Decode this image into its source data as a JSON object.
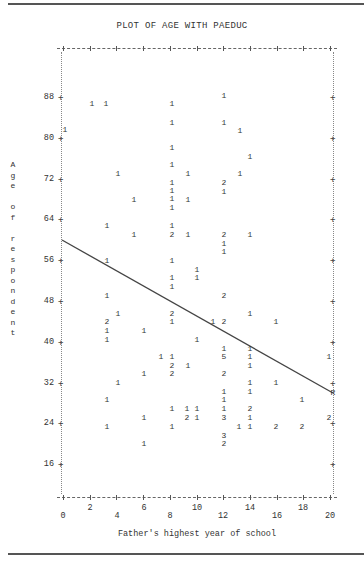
{
  "page": {
    "title": "PLOT OF AGE WITH PAEDUC",
    "ylabel": "Age of respondent",
    "ylabel_chars": [
      "A",
      "g",
      "e",
      " ",
      "o",
      "f",
      " ",
      "r",
      "e",
      "s",
      "p",
      "o",
      "n",
      "d",
      "e",
      "n",
      "t"
    ],
    "xlabel": "Father's highest year of school",
    "regression_marker": "R"
  },
  "axes": {
    "y_ticks": [
      "88",
      "80",
      "72",
      "64",
      "56",
      "48",
      "40",
      "32",
      "24",
      "16"
    ],
    "x_ticks_upper": [
      "2",
      "6",
      "10",
      "14",
      "18"
    ],
    "x_ticks_lower": [
      "0",
      "4",
      "8",
      "12",
      "16",
      "20"
    ]
  },
  "chart_data": {
    "type": "scatter",
    "title": "PLOT OF AGE WITH PAEDUC",
    "xlabel": "Father's highest year of school",
    "ylabel": "Age of respondent",
    "xlim": [
      0,
      20
    ],
    "ylim": [
      16,
      88
    ],
    "x_ticks": [
      0,
      2,
      4,
      6,
      8,
      10,
      12,
      14,
      16,
      18,
      20
    ],
    "y_ticks": [
      16,
      24,
      32,
      40,
      48,
      56,
      64,
      72,
      80,
      88
    ],
    "grid": false,
    "legend": "none",
    "marker_note": "digits indicate number of cases at each plotted position",
    "regression_line": {
      "x0": 0,
      "y0": 56.5,
      "x1": 20,
      "y1": 28.5,
      "endpoint_label": "R"
    },
    "points": [
      {
        "x": 2.3,
        "y": 81.5,
        "n": 1
      },
      {
        "x": 3.3,
        "y": 81.5,
        "n": 1
      },
      {
        "x": 8.0,
        "y": 81.5,
        "n": 1
      },
      {
        "x": 12.0,
        "y": 83.5,
        "n": 1
      },
      {
        "x": 0.2,
        "y": 76.5,
        "n": 1
      },
      {
        "x": 8.0,
        "y": 78.5,
        "n": 1
      },
      {
        "x": 12.0,
        "y": 78.5,
        "n": 1
      },
      {
        "x": 13.2,
        "y": 77.0,
        "n": 1
      },
      {
        "x": 8.0,
        "y": 73.5,
        "n": 1
      },
      {
        "x": 14.0,
        "y": 71.5,
        "n": 1
      },
      {
        "x": 8.0,
        "y": 70.5,
        "n": 1
      },
      {
        "x": 4.2,
        "y": 68.0,
        "n": 1
      },
      {
        "x": 8.0,
        "y": 67.5,
        "n": 1
      },
      {
        "x": 9.2,
        "y": 68.0,
        "n": 1
      },
      {
        "x": 13.2,
        "y": 68.0,
        "n": 1
      },
      {
        "x": 8.0,
        "y": 66.0,
        "n": 1
      },
      {
        "x": 12.0,
        "y": 66.5,
        "n": 2
      },
      {
        "x": 8.0,
        "y": 64.5,
        "n": 1
      },
      {
        "x": 12.0,
        "y": 64.5,
        "n": 1
      },
      {
        "x": 5.2,
        "y": 63.0,
        "n": 1
      },
      {
        "x": 9.2,
        "y": 63.0,
        "n": 1
      },
      {
        "x": 8.0,
        "y": 62.0,
        "n": 1
      },
      {
        "x": 3.3,
        "y": 59.5,
        "n": 1
      },
      {
        "x": 8.0,
        "y": 59.5,
        "n": 1
      },
      {
        "x": 5.2,
        "y": 58.0,
        "n": 1
      },
      {
        "x": 8.0,
        "y": 58.0,
        "n": 2
      },
      {
        "x": 9.2,
        "y": 58.0,
        "n": 1
      },
      {
        "x": 12.0,
        "y": 58.0,
        "n": 2
      },
      {
        "x": 14.0,
        "y": 58.0,
        "n": 1
      },
      {
        "x": 12.0,
        "y": 56.5,
        "n": 1
      },
      {
        "x": 12.0,
        "y": 55.0,
        "n": 1
      },
      {
        "x": 3.3,
        "y": 52.5,
        "n": 1
      },
      {
        "x": 8.0,
        "y": 52.5,
        "n": 1
      },
      {
        "x": 10.0,
        "y": 51.0,
        "n": 1
      },
      {
        "x": 8.0,
        "y": 49.5,
        "n": 1
      },
      {
        "x": 10.0,
        "y": 49.5,
        "n": 1
      },
      {
        "x": 8.0,
        "y": 48.0,
        "n": 1
      },
      {
        "x": 3.3,
        "y": 46.5,
        "n": 1
      },
      {
        "x": 12.0,
        "y": 46.5,
        "n": 2
      },
      {
        "x": 4.0,
        "y": 43.5,
        "n": 1
      },
      {
        "x": 8.0,
        "y": 43.5,
        "n": 2
      },
      {
        "x": 14.0,
        "y": 43.5,
        "n": 1
      },
      {
        "x": 3.3,
        "y": 42.0,
        "n": 2
      },
      {
        "x": 8.0,
        "y": 42.0,
        "n": 1
      },
      {
        "x": 11.5,
        "y": 42.0,
        "n": 1
      },
      {
        "x": 12.0,
        "y": 42.0,
        "n": 2
      },
      {
        "x": 16.0,
        "y": 42.0,
        "n": 1
      },
      {
        "x": 3.3,
        "y": 40.5,
        "n": 1
      },
      {
        "x": 6.0,
        "y": 40.5,
        "n": 1
      },
      {
        "x": 3.3,
        "y": 39.0,
        "n": 1
      },
      {
        "x": 10.0,
        "y": 39.0,
        "n": 1
      },
      {
        "x": 12.0,
        "y": 37.0,
        "n": 1
      },
      {
        "x": 14.0,
        "y": 37.0,
        "n": 1
      },
      {
        "x": 7.5,
        "y": 35.5,
        "n": 1
      },
      {
        "x": 8.0,
        "y": 35.5,
        "n": 1
      },
      {
        "x": 12.0,
        "y": 35.5,
        "n": 5
      },
      {
        "x": 14.0,
        "y": 35.5,
        "n": 1
      },
      {
        "x": 20.0,
        "y": 35.5,
        "n": 1
      },
      {
        "x": 8.0,
        "y": 34.0,
        "n": 2
      },
      {
        "x": 9.2,
        "y": 34.0,
        "n": 1
      },
      {
        "x": 14.0,
        "y": 34.0,
        "n": 1
      },
      {
        "x": 6.0,
        "y": 32.5,
        "n": 1
      },
      {
        "x": 8.0,
        "y": 32.5,
        "n": 2
      },
      {
        "x": 12.0,
        "y": 32.5,
        "n": 2
      },
      {
        "x": 4.0,
        "y": 30.5,
        "n": 1
      },
      {
        "x": 14.0,
        "y": 30.5,
        "n": 1
      },
      {
        "x": 16.0,
        "y": 30.5,
        "n": 1
      },
      {
        "x": 12.0,
        "y": 29.0,
        "n": 1
      },
      {
        "x": 14.0,
        "y": 29.0,
        "n": 1
      },
      {
        "x": 3.3,
        "y": 27.5,
        "n": 1
      },
      {
        "x": 12.0,
        "y": 27.5,
        "n": 1
      },
      {
        "x": 18.0,
        "y": 27.5,
        "n": 1
      },
      {
        "x": 8.0,
        "y": 26.0,
        "n": 1
      },
      {
        "x": 9.2,
        "y": 26.0,
        "n": 1
      },
      {
        "x": 10.0,
        "y": 26.0,
        "n": 1
      },
      {
        "x": 12.0,
        "y": 26.0,
        "n": 1
      },
      {
        "x": 14.0,
        "y": 26.0,
        "n": 2
      },
      {
        "x": 6.0,
        "y": 24.5,
        "n": 1
      },
      {
        "x": 9.2,
        "y": 24.5,
        "n": 2
      },
      {
        "x": 10.0,
        "y": 24.5,
        "n": 1
      },
      {
        "x": 12.0,
        "y": 24.5,
        "n": 3
      },
      {
        "x": 14.0,
        "y": 24.5,
        "n": 1
      },
      {
        "x": 20.0,
        "y": 24.5,
        "n": 2
      },
      {
        "x": 3.3,
        "y": 23.0,
        "n": 1
      },
      {
        "x": 8.0,
        "y": 23.0,
        "n": 1
      },
      {
        "x": 13.2,
        "y": 23.0,
        "n": 1
      },
      {
        "x": 14.0,
        "y": 23.0,
        "n": 1
      },
      {
        "x": 16.0,
        "y": 23.0,
        "n": 2
      },
      {
        "x": 18.0,
        "y": 23.0,
        "n": 2
      },
      {
        "x": 12.0,
        "y": 21.5,
        "n": 3
      },
      {
        "x": 6.0,
        "y": 20.0,
        "n": 1
      },
      {
        "x": 12.0,
        "y": 20.0,
        "n": 2
      }
    ]
  },
  "markers": [
    {
      "px": 92,
      "py": 104,
      "n": "1"
    },
    {
      "px": 106,
      "py": 104,
      "n": "1"
    },
    {
      "px": 172,
      "py": 104,
      "n": "1"
    },
    {
      "px": 224,
      "py": 96,
      "n": "1"
    },
    {
      "px": 65,
      "py": 130,
      "n": "1"
    },
    {
      "px": 172,
      "py": 123,
      "n": "1"
    },
    {
      "px": 224,
      "py": 123,
      "n": "1"
    },
    {
      "px": 240,
      "py": 131,
      "n": "1"
    },
    {
      "px": 172,
      "py": 148,
      "n": "1"
    },
    {
      "px": 250,
      "py": 157,
      "n": "1"
    },
    {
      "px": 172,
      "py": 165,
      "n": "1"
    },
    {
      "px": 118,
      "py": 174,
      "n": "1"
    },
    {
      "px": 172,
      "py": 183,
      "n": "1"
    },
    {
      "px": 188,
      "py": 174,
      "n": "1"
    },
    {
      "px": 240,
      "py": 174,
      "n": "1"
    },
    {
      "px": 172,
      "py": 191,
      "n": "1"
    },
    {
      "px": 224,
      "py": 183,
      "n": "2"
    },
    {
      "px": 172,
      "py": 199,
      "n": "1"
    },
    {
      "px": 224,
      "py": 192,
      "n": "1"
    },
    {
      "px": 134,
      "py": 200,
      "n": "1"
    },
    {
      "px": 188,
      "py": 200,
      "n": "1"
    },
    {
      "px": 172,
      "py": 208,
      "n": "1"
    },
    {
      "px": 107,
      "py": 226,
      "n": "1"
    },
    {
      "px": 172,
      "py": 226,
      "n": "1"
    },
    {
      "px": 134,
      "py": 235,
      "n": "1"
    },
    {
      "px": 172,
      "py": 235,
      "n": "2"
    },
    {
      "px": 188,
      "py": 235,
      "n": "1"
    },
    {
      "px": 224,
      "py": 235,
      "n": "2"
    },
    {
      "px": 250,
      "py": 235,
      "n": "1"
    },
    {
      "px": 224,
      "py": 244,
      "n": "1"
    },
    {
      "px": 224,
      "py": 252,
      "n": "1"
    },
    {
      "px": 107,
      "py": 261,
      "n": "1"
    },
    {
      "px": 172,
      "py": 261,
      "n": "1"
    },
    {
      "px": 197,
      "py": 270,
      "n": "1"
    },
    {
      "px": 172,
      "py": 278,
      "n": "1"
    },
    {
      "px": 197,
      "py": 278,
      "n": "1"
    },
    {
      "px": 172,
      "py": 287,
      "n": "1"
    },
    {
      "px": 107,
      "py": 296,
      "n": "1"
    },
    {
      "px": 224,
      "py": 296,
      "n": "2"
    },
    {
      "px": 118,
      "py": 314,
      "n": "1"
    },
    {
      "px": 172,
      "py": 314,
      "n": "2"
    },
    {
      "px": 250,
      "py": 314,
      "n": "1"
    },
    {
      "px": 107,
      "py": 322,
      "n": "2"
    },
    {
      "px": 172,
      "py": 322,
      "n": "1"
    },
    {
      "px": 213,
      "py": 322,
      "n": "1"
    },
    {
      "px": 224,
      "py": 322,
      "n": "2"
    },
    {
      "px": 276,
      "py": 322,
      "n": "1"
    },
    {
      "px": 107,
      "py": 331,
      "n": "1"
    },
    {
      "px": 144,
      "py": 331,
      "n": "1"
    },
    {
      "px": 107,
      "py": 340,
      "n": "1"
    },
    {
      "px": 197,
      "py": 340,
      "n": "1"
    },
    {
      "px": 224,
      "py": 349,
      "n": "1"
    },
    {
      "px": 250,
      "py": 349,
      "n": "1"
    },
    {
      "px": 161,
      "py": 357,
      "n": "1"
    },
    {
      "px": 172,
      "py": 357,
      "n": "1"
    },
    {
      "px": 224,
      "py": 357,
      "n": "5"
    },
    {
      "px": 250,
      "py": 357,
      "n": "1"
    },
    {
      "px": 329,
      "py": 357,
      "n": "1"
    },
    {
      "px": 172,
      "py": 366,
      "n": "2"
    },
    {
      "px": 188,
      "py": 366,
      "n": "1"
    },
    {
      "px": 250,
      "py": 366,
      "n": "1"
    },
    {
      "px": 144,
      "py": 374,
      "n": "1"
    },
    {
      "px": 172,
      "py": 374,
      "n": "2"
    },
    {
      "px": 224,
      "py": 374,
      "n": "2"
    },
    {
      "px": 118,
      "py": 383,
      "n": "1"
    },
    {
      "px": 250,
      "py": 383,
      "n": "1"
    },
    {
      "px": 276,
      "py": 383,
      "n": "1"
    },
    {
      "px": 224,
      "py": 392,
      "n": "1"
    },
    {
      "px": 250,
      "py": 392,
      "n": "1"
    },
    {
      "px": 107,
      "py": 400,
      "n": "1"
    },
    {
      "px": 224,
      "py": 400,
      "n": "1"
    },
    {
      "px": 302,
      "py": 400,
      "n": "1"
    },
    {
      "px": 172,
      "py": 409,
      "n": "1"
    },
    {
      "px": 187,
      "py": 409,
      "n": "1"
    },
    {
      "px": 197,
      "py": 409,
      "n": "1"
    },
    {
      "px": 224,
      "py": 409,
      "n": "1"
    },
    {
      "px": 250,
      "py": 409,
      "n": "2"
    },
    {
      "px": 144,
      "py": 418,
      "n": "1"
    },
    {
      "px": 187,
      "py": 418,
      "n": "2"
    },
    {
      "px": 197,
      "py": 418,
      "n": "1"
    },
    {
      "px": 224,
      "py": 418,
      "n": "3"
    },
    {
      "px": 250,
      "py": 418,
      "n": "1"
    },
    {
      "px": 329,
      "py": 418,
      "n": "2"
    },
    {
      "px": 107,
      "py": 427,
      "n": "1"
    },
    {
      "px": 172,
      "py": 427,
      "n": "1"
    },
    {
      "px": 239,
      "py": 427,
      "n": "1"
    },
    {
      "px": 250,
      "py": 427,
      "n": "1"
    },
    {
      "px": 276,
      "py": 427,
      "n": "2"
    },
    {
      "px": 302,
      "py": 427,
      "n": "2"
    },
    {
      "px": 224,
      "py": 436,
      "n": "3"
    },
    {
      "px": 144,
      "py": 444,
      "n": "1"
    },
    {
      "px": 224,
      "py": 444,
      "n": "2"
    }
  ]
}
